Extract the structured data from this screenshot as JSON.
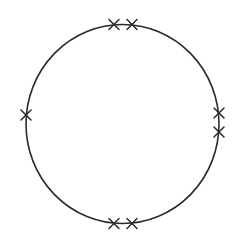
{
  "diagram": {
    "type": "circle-with-marks",
    "circle": {
      "cx": 122.5,
      "cy": 124,
      "rx": 96.5,
      "ry": 99.5,
      "stroke": "#2a2a2a"
    },
    "mark_glyph": "x-mark",
    "mark_size": 5,
    "marks": [
      {
        "id": "top-left",
        "x": 114,
        "y": 24.5
      },
      {
        "id": "top-right",
        "x": 132,
        "y": 24.5
      },
      {
        "id": "left",
        "x": 26,
        "y": 115
      },
      {
        "id": "right-upper",
        "x": 219,
        "y": 113
      },
      {
        "id": "right-lower",
        "x": 219,
        "y": 132
      },
      {
        "id": "bottom-left",
        "x": 114,
        "y": 223.5
      },
      {
        "id": "bottom-right",
        "x": 132,
        "y": 223.5
      }
    ],
    "mark_count": 7
  }
}
